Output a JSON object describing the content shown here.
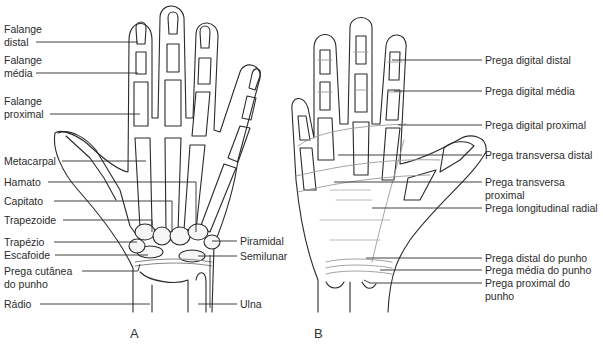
{
  "figure": {
    "panels": [
      {
        "id": "A",
        "letter": "A",
        "view": "dorsal skeleton",
        "labels_left": [
          {
            "line1": "Falange",
            "line2": "distal"
          },
          {
            "line1": "Falange",
            "line2": "média"
          },
          {
            "line1": "Falange",
            "line2": "proximal"
          },
          {
            "line1": "Metacarpal"
          },
          {
            "line1": "Hamato"
          },
          {
            "line1": "Capitato"
          },
          {
            "line1": "Trapezoide"
          },
          {
            "line1": "Trapézio"
          },
          {
            "line1": "Escafoide"
          },
          {
            "line1": "Prega cutânea",
            "line2": "do punho"
          },
          {
            "line1": "Rádio"
          }
        ],
        "labels_right": [
          {
            "line1": "Piramidal"
          },
          {
            "line1": "Semilunar"
          },
          {
            "line1": "Ulna"
          }
        ]
      },
      {
        "id": "B",
        "letter": "B",
        "view": "palmar creases",
        "labels_right": [
          {
            "line1": "Prega digital distal"
          },
          {
            "line1": "Prega digital média"
          },
          {
            "line1": "Prega digital proximal"
          },
          {
            "line1": "Prega transversa distal"
          },
          {
            "line1": "Prega transversa",
            "line2": "proximal"
          },
          {
            "line1": "Prega longitudinal radial"
          },
          {
            "line1": "Prega distal do punho"
          },
          {
            "line1": "Prega média do punho"
          },
          {
            "line1": "Prega proximal do",
            "line2": "punho"
          }
        ]
      }
    ],
    "colors": {
      "line": "#2a2a2a",
      "bone_fill": "#f6f6f6",
      "crease": "#9a9a9a",
      "background": "#ffffff"
    }
  }
}
